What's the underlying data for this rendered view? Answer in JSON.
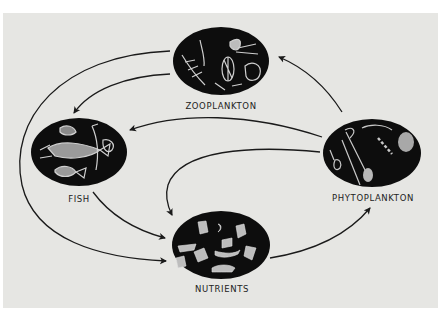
{
  "diagram": {
    "type": "food-cycle",
    "nodes": [
      {
        "id": "zooplankton",
        "label": "ZOOPLANKTON",
        "cx": 221,
        "cy": 61,
        "label_x": 221,
        "label_y": 101
      },
      {
        "id": "fish",
        "label": "FISH",
        "cx": 79,
        "cy": 152,
        "label_x": 79,
        "label_y": 194
      },
      {
        "id": "phytoplankton",
        "label": "PHYTOPLANKTON",
        "cx": 372,
        "cy": 153,
        "label_x": 373,
        "label_y": 193
      },
      {
        "id": "nutrients",
        "label": "NUTRIENTS",
        "cx": 221,
        "cy": 245,
        "label_x": 222,
        "label_y": 284
      }
    ],
    "edges": [
      {
        "from": "zooplankton",
        "to": "fish"
      },
      {
        "from": "zooplankton",
        "to": "nutrients"
      },
      {
        "from": "phytoplankton",
        "to": "zooplankton"
      },
      {
        "from": "phytoplankton",
        "to": "fish"
      },
      {
        "from": "phytoplankton",
        "to": "nutrients"
      },
      {
        "from": "fish",
        "to": "nutrients"
      },
      {
        "from": "nutrients",
        "to": "phytoplankton"
      }
    ],
    "colors": {
      "background": "#e6e6e3",
      "node_fill": "#0d0d0d",
      "arrow": "#1a1a1a",
      "text": "#222222"
    }
  }
}
